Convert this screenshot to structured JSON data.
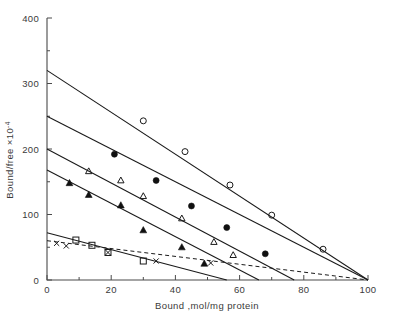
{
  "chart_data": {
    "type": "scatter",
    "title": "",
    "xlabel": "Bound ,mol/mg protein",
    "ylabel": "Bound/free ×10⁻⁴",
    "ylabel_base": "Bound/free ×10",
    "ylabel_exp": "-4",
    "xlim": [
      0,
      100
    ],
    "ylim": [
      0,
      400
    ],
    "xticks": [
      0,
      20,
      40,
      60,
      80,
      100
    ],
    "xtick_labels": [
      "0",
      "20",
      "40",
      "60",
      "80",
      "100"
    ],
    "xminor_step": 10,
    "yticks": [
      0,
      100,
      200,
      300,
      400
    ],
    "ytick_labels": [
      "0",
      "100",
      "200",
      "300",
      "400"
    ],
    "yminor_step": 50,
    "grid": false,
    "legend_position": "none",
    "series": [
      {
        "name": "open-circle",
        "marker": "open-circle",
        "line_style": "solid",
        "line": {
          "x0": 0,
          "y0": 320,
          "x1": 100,
          "y1": 0
        },
        "points": [
          {
            "x": 30,
            "y": 243
          },
          {
            "x": 43,
            "y": 196
          },
          {
            "x": 57,
            "y": 145
          },
          {
            "x": 70,
            "y": 99
          },
          {
            "x": 86,
            "y": 47
          }
        ]
      },
      {
        "name": "filled-circle",
        "marker": "filled-circle",
        "line_style": "solid",
        "line": {
          "x0": 0,
          "y0": 250,
          "x1": 100,
          "y1": 0
        },
        "points": [
          {
            "x": 21,
            "y": 192
          },
          {
            "x": 34,
            "y": 152
          },
          {
            "x": 45,
            "y": 113
          },
          {
            "x": 56,
            "y": 80
          },
          {
            "x": 68,
            "y": 40
          }
        ]
      },
      {
        "name": "open-triangle",
        "marker": "open-triangle",
        "line_style": "solid",
        "line": {
          "x0": 0,
          "y0": 200,
          "x1": 77,
          "y1": 0
        },
        "points": [
          {
            "x": 13,
            "y": 166
          },
          {
            "x": 23,
            "y": 152
          },
          {
            "x": 30,
            "y": 128
          },
          {
            "x": 42,
            "y": 94
          },
          {
            "x": 52,
            "y": 58
          },
          {
            "x": 58,
            "y": 38
          }
        ]
      },
      {
        "name": "filled-triangle",
        "marker": "filled-triangle",
        "line_style": "solid",
        "line": {
          "x0": 0,
          "y0": 168,
          "x1": 66,
          "y1": 0
        },
        "points": [
          {
            "x": 7,
            "y": 148
          },
          {
            "x": 13,
            "y": 130
          },
          {
            "x": 23,
            "y": 114
          },
          {
            "x": 30,
            "y": 76
          },
          {
            "x": 42,
            "y": 50
          },
          {
            "x": 49,
            "y": 25
          }
        ]
      },
      {
        "name": "open-square",
        "marker": "open-square",
        "line_style": "solid",
        "line": {
          "x0": 0,
          "y0": 72,
          "x1": 56,
          "y1": 0
        },
        "points": [
          {
            "x": 9,
            "y": 61
          },
          {
            "x": 14,
            "y": 53
          },
          {
            "x": 19,
            "y": 42
          },
          {
            "x": 30,
            "y": 29
          }
        ]
      },
      {
        "name": "cross",
        "marker": "cross",
        "line_style": "dashed",
        "line": {
          "x0": 0,
          "y0": 60,
          "x1": 100,
          "y1": 0
        },
        "points": [
          {
            "x": 3,
            "y": 56
          },
          {
            "x": 6,
            "y": 52
          },
          {
            "x": 19,
            "y": 42
          },
          {
            "x": 34,
            "y": 29
          },
          {
            "x": 51,
            "y": 26
          }
        ]
      }
    ]
  },
  "colors": {
    "axis": "#4a4a4a",
    "line": "#1a1a1a",
    "text": "#3a3a3a",
    "background": "#ffffff"
  }
}
